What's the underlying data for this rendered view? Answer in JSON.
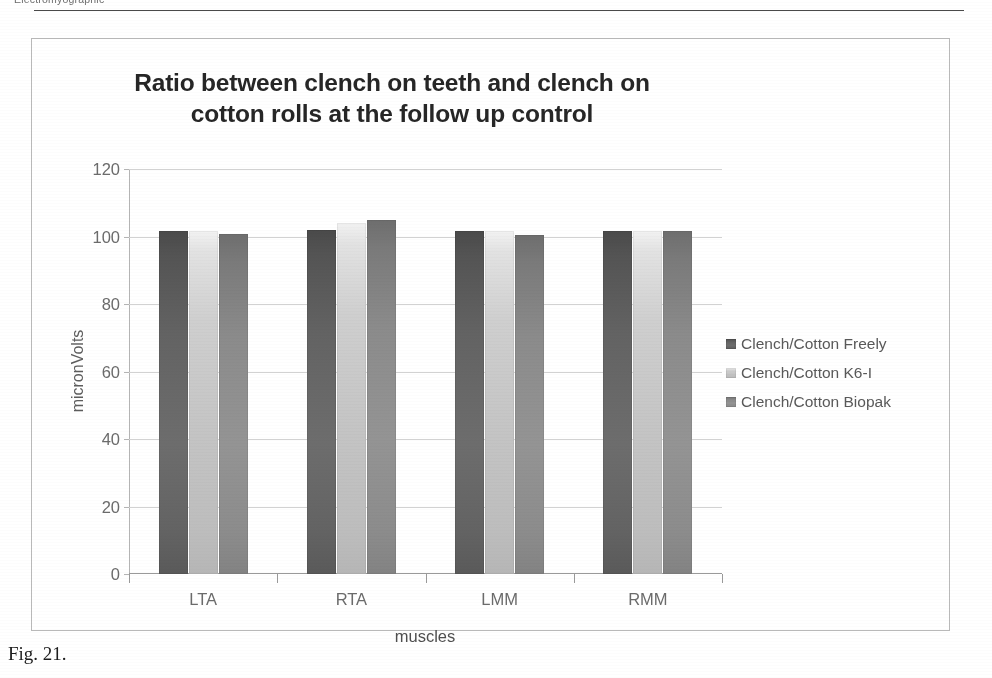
{
  "page": {
    "running_header": "Electromyographic",
    "figure_caption": "Fig. 21."
  },
  "chart_data": {
    "type": "bar",
    "title": "Ratio between clench on teeth and clench on cotton rolls at the follow up control",
    "title_line1": "Ratio between clench on teeth and clench on",
    "title_line2": "cotton rolls at the follow up control",
    "xlabel": "muscles",
    "ylabel": "micronVolts",
    "categories": [
      "LTA",
      "RTA",
      "LMM",
      "RMM"
    ],
    "ylim": [
      0,
      120
    ],
    "yticks": [
      0,
      20,
      40,
      60,
      80,
      100,
      120
    ],
    "ytick_labels": [
      "0",
      "20",
      "40",
      "60",
      "80",
      "100",
      "120"
    ],
    "grid": "horizontal",
    "legend_position": "right",
    "series": [
      {
        "name": "Clench/Cotton Freely",
        "color": "#636363",
        "values": [
          101.5,
          102.0,
          101.5,
          101.5
        ]
      },
      {
        "name": "Clench/Cotton K6-I",
        "color": "#c4c4c4",
        "values": [
          101.5,
          104.0,
          101.5,
          101.5
        ]
      },
      {
        "name": "Clench/Cotton Biopak",
        "color": "#949494",
        "values": [
          100.8,
          104.8,
          100.5,
          101.5
        ]
      }
    ]
  }
}
